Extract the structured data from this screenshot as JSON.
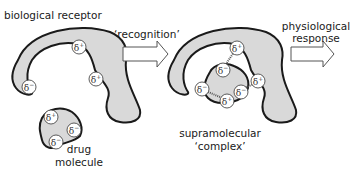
{
  "labels": {
    "receptor": "biological receptor",
    "recognition": "‘recognition’",
    "response_line1": "physiological",
    "response_line2": "response",
    "drug_line1": "drug",
    "drug_line2": "molecule",
    "complex_line1": "supramolecular",
    "complex_line2": "‘complex’"
  },
  "charges": {
    "plus": "δ+",
    "minus": "δ−"
  },
  "colors": {
    "fill": "#d9d9d9",
    "stroke": "#1a1a1a",
    "arrow_fill": "#ffffff",
    "text": "#1a1a1a"
  }
}
